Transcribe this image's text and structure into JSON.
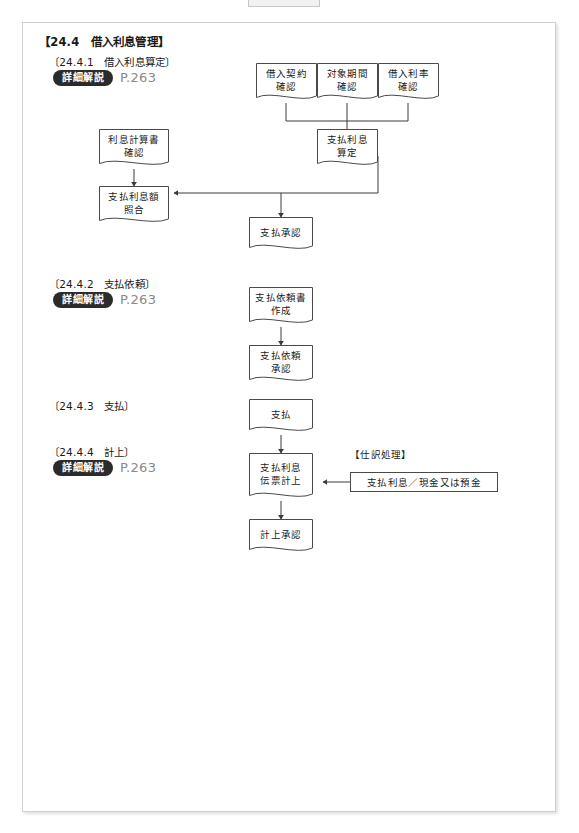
{
  "document": {
    "section_title": "【24.4　借入利息管理】",
    "reference_page": "P.263",
    "badge_label": "詳細解説"
  },
  "subsections": [
    {
      "id": "24.4.1",
      "heading": "〔24.4.1　借入利息算定〕",
      "has_reference": true
    },
    {
      "id": "24.4.2",
      "heading": "〔24.4.2　支払依頼〕",
      "has_reference": true
    },
    {
      "id": "24.4.3",
      "heading": "〔24.4.3　支払〕",
      "has_reference": false
    },
    {
      "id": "24.4.4",
      "heading": "〔24.4.4　計上〕",
      "has_reference": true
    }
  ],
  "nodes": [
    {
      "id": "n1",
      "lines": [
        "借入契約",
        "確認"
      ],
      "shape": "document"
    },
    {
      "id": "n2",
      "lines": [
        "対象期間",
        "確認"
      ],
      "shape": "document"
    },
    {
      "id": "n3",
      "lines": [
        "借入利率",
        "確認"
      ],
      "shape": "document"
    },
    {
      "id": "n4",
      "lines": [
        "利息計算書",
        "確認"
      ],
      "shape": "document"
    },
    {
      "id": "n5",
      "lines": [
        "支払利息",
        "算定"
      ],
      "shape": "document"
    },
    {
      "id": "n6",
      "lines": [
        "支払利息額",
        "照合"
      ],
      "shape": "document"
    },
    {
      "id": "n7",
      "lines": [
        "支払承認"
      ],
      "shape": "document"
    },
    {
      "id": "n8",
      "lines": [
        "支払依頼書",
        "作成"
      ],
      "shape": "document"
    },
    {
      "id": "n9",
      "lines": [
        "支払依頼",
        "承認"
      ],
      "shape": "document"
    },
    {
      "id": "n10",
      "lines": [
        "支払"
      ],
      "shape": "document"
    },
    {
      "id": "n11",
      "lines": [
        "支払利息",
        "伝票計上"
      ],
      "shape": "document"
    },
    {
      "id": "n12",
      "lines": [
        "計上承認"
      ],
      "shape": "document"
    }
  ],
  "annotation": {
    "label": "【仕訳処理】",
    "entry": "支払利息／現金又は預金"
  },
  "colors": {
    "node_border": "#4a4a4a",
    "connector": "#3a3a3a",
    "badge_bg": "#2b2b2b",
    "page_ref": "#8a8a8a",
    "sheet_border": "#cfcfcf"
  }
}
